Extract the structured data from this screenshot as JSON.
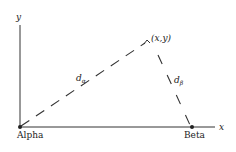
{
  "diagram": {
    "type": "triangulation-geometry",
    "axes": {
      "x_label": "x",
      "y_label": "y"
    },
    "points": {
      "alpha": {
        "label": "Alpha"
      },
      "beta": {
        "label": "Beta"
      },
      "target": {
        "label": "(x,y)"
      }
    },
    "distances": {
      "d_alpha": {
        "symbol": "d",
        "subscript": "α"
      },
      "d_beta": {
        "symbol": "d",
        "subscript": "β"
      }
    },
    "colors": {
      "ink": "#222222",
      "background": "#ffffff"
    }
  }
}
